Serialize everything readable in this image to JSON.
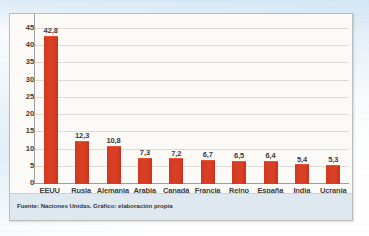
{
  "chart_data": {
    "type": "bar",
    "title": "",
    "subtitle": "",
    "xlabel": "",
    "ylabel": "",
    "categories": [
      "EEUU",
      "Rusia",
      "Alemania",
      "Arabia Saudí",
      "Canadá",
      "Francia",
      "Reino Unido",
      "España",
      "India",
      "Ucrania"
    ],
    "values": [
      42.8,
      12.3,
      10.8,
      7.3,
      7.2,
      6.7,
      6.5,
      6.4,
      5.4,
      5.3
    ],
    "value_labels": [
      "42,8",
      "12,3",
      "10,8",
      "7,3",
      "7,2",
      "6,7",
      "6,5",
      "6,4",
      "5,4",
      "5,3"
    ],
    "category_lines": [
      [
        "EEUU"
      ],
      [
        "Rusia"
      ],
      [
        "Alemania"
      ],
      [
        "Arabia",
        "Saudí"
      ],
      [
        "Canadá"
      ],
      [
        "Francia"
      ],
      [
        "Reino",
        "Unido"
      ],
      [
        "España"
      ],
      [
        "India"
      ],
      [
        "Ucrania"
      ]
    ],
    "ylim": [
      0,
      45
    ],
    "ytick_step": 5,
    "ytick_labels": [
      "45",
      "40",
      "35",
      "30",
      "25",
      "20",
      "15",
      "10",
      "5",
      "0"
    ],
    "ytick_values": [
      45,
      40,
      35,
      30,
      25,
      20,
      15,
      10,
      5,
      0
    ],
    "grid": true,
    "grid_axis": "y",
    "legend": false,
    "legend_position": "none",
    "bar_color": "#d83f25",
    "series": [
      {
        "name": "",
        "values": [
          42.8,
          12.3,
          10.8,
          7.3,
          7.2,
          6.7,
          6.5,
          6.4,
          5.4,
          5.3
        ]
      }
    ]
  },
  "footer": {
    "source_text": "Fuente: Naciones Unidas. Gráfico: elaboración propia"
  },
  "colors": {
    "bar": "#d83f25",
    "grid": "#dedad1",
    "axis": "#9aa0a1",
    "plot_background": "#fbfaf6",
    "source_band": "#dfe8ef",
    "text": "#3b3b3b"
  }
}
